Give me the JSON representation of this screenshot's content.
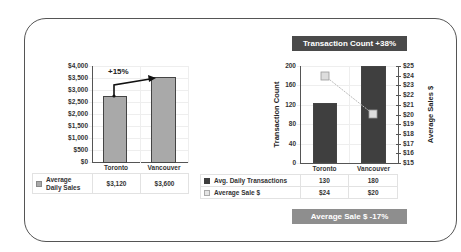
{
  "chart_data": [
    {
      "type": "bar",
      "title": "",
      "categories": [
        "Toronto",
        "Vancouver"
      ],
      "series": [
        {
          "name": "Average Daily Sales",
          "values": [
            3120,
            3600
          ],
          "display": [
            "$3,120",
            "$3,600"
          ]
        }
      ],
      "ylabel": "",
      "ylim": [
        0,
        4000
      ],
      "yticks": [
        "$4,000",
        "$3,500",
        "$3,000",
        "$2,500",
        "$2,000",
        "$1,500",
        "$1,000",
        "$500",
        "$0"
      ],
      "annotation": "+15%",
      "grid": true,
      "data_table": true
    },
    {
      "type": "bar+line",
      "title": "Transaction Count +38%",
      "footer": "Average Sale $ -17%",
      "categories": [
        "Toronto",
        "Vancouver"
      ],
      "series": [
        {
          "name": "Avg. Daily Transactions",
          "type": "bar",
          "axis": "left",
          "values": [
            130,
            180
          ]
        },
        {
          "name": "Average Sale $",
          "type": "line",
          "axis": "right",
          "values": [
            24,
            20
          ],
          "display": [
            "$24",
            "$20"
          ]
        }
      ],
      "ylabel": "Transaction Count",
      "ylim": [
        0,
        200
      ],
      "yticks": [
        "200",
        "160",
        "120",
        "80",
        "40",
        "0"
      ],
      "y2label": "Average Sales $",
      "y2lim": [
        15,
        25
      ],
      "y2ticks": [
        "$25",
        "$24",
        "$23",
        "$22",
        "$21",
        "$20",
        "$19",
        "$18",
        "$17",
        "$16",
        "$15"
      ],
      "grid": true,
      "data_table": true
    }
  ],
  "left": {
    "annotation": "+15%",
    "categories": [
      "Toronto",
      "Vancouver"
    ],
    "yticks": [
      "$4,000",
      "$3,500",
      "$3,000",
      "$2,500",
      "$2,000",
      "$1,500",
      "$1,000",
      "$500",
      "$0"
    ],
    "table": {
      "series": "Average Daily Sales",
      "series_l1": "Average",
      "series_l2": "Daily Sales",
      "values": [
        "$3,120",
        "$3,600"
      ]
    }
  },
  "right": {
    "banner_top": "Transaction Count +38%",
    "banner_bottom": "Average Sale $ -17%",
    "ylabel": "Transaction Count",
    "y2label": "Average Sales $",
    "yticks": [
      "200",
      "160",
      "120",
      "80",
      "40",
      "0"
    ],
    "y2ticks": [
      "$25",
      "$24",
      "$23",
      "$22",
      "$21",
      "$20",
      "$19",
      "$18",
      "$17",
      "$16",
      "$15"
    ],
    "categories": [
      "Toronto",
      "Vancouver"
    ],
    "table": {
      "rows": [
        {
          "label": "Avg. Daily Transactions",
          "values": [
            "130",
            "180"
          ]
        },
        {
          "label": "Average Sale $",
          "values": [
            "$24",
            "$20"
          ]
        }
      ]
    }
  },
  "colors": {
    "left_bar": "#a9a9a9",
    "right_bar": "#3f3f3f",
    "line": "#c8c8c8",
    "banner_top": "#4a4a4a",
    "banner_bottom": "#8e8e8e"
  }
}
